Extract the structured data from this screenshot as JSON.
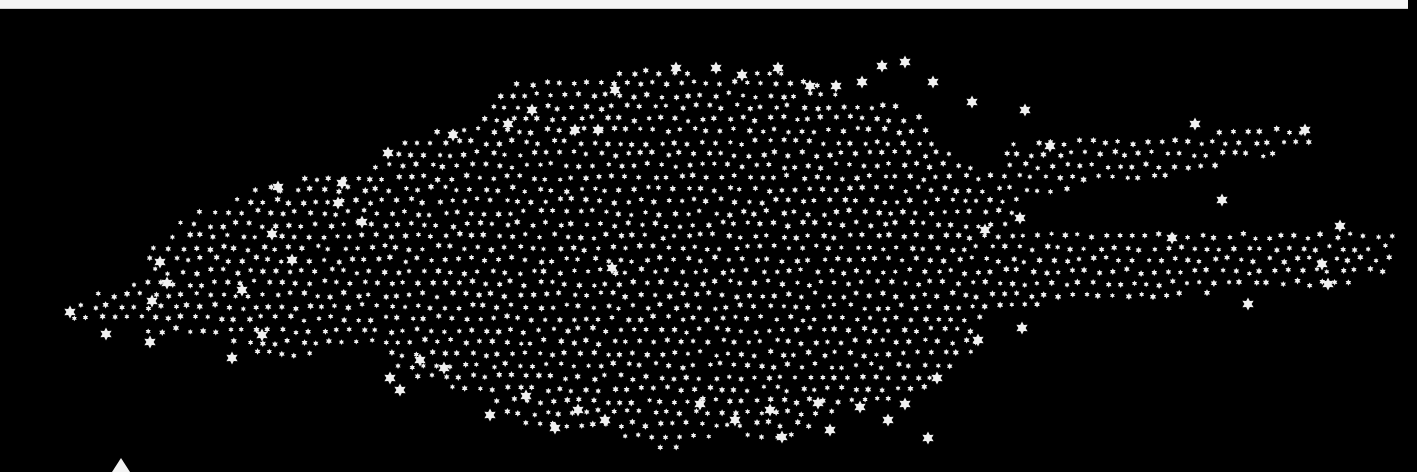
{
  "canvas": {
    "width": 1417,
    "height": 469,
    "background": "#000000"
  },
  "top_strip": {
    "color": "#f4f4f4",
    "height": 8,
    "width": 1408
  },
  "marker_triangle": {
    "x": 121,
    "y": 458,
    "color": "#f2f2f2"
  },
  "star_color": "#f0f0f0",
  "cluster": {
    "seed": 7,
    "small_star_radius": 3.2,
    "spacing": 13.5,
    "regions": [
      {
        "name": "core",
        "type": "ellipse",
        "cx": 680,
        "cy": 255,
        "rx": 345,
        "ry": 185
      },
      {
        "name": "left-wing",
        "type": "ellipse",
        "cx": 300,
        "cy": 270,
        "rx": 150,
        "ry": 85
      },
      {
        "name": "left-tail",
        "type": "band",
        "x0": 70,
        "x1": 260,
        "y_top0": 300,
        "y_top1": 255,
        "y_bot0": 322,
        "y_bot1": 345
      },
      {
        "name": "upper-left-spur",
        "type": "band",
        "x0": 275,
        "x1": 420,
        "y_top0": 180,
        "y_top1": 160,
        "y_bot0": 200,
        "y_bot1": 215
      },
      {
        "name": "right-upper-arm",
        "type": "band",
        "x0": 1000,
        "x1": 1310,
        "y_top0": 145,
        "y_top1": 125,
        "y_bot0": 205,
        "y_bot1": 150
      },
      {
        "name": "right-lower-arm",
        "type": "band",
        "x0": 990,
        "x1": 1395,
        "y_top0": 232,
        "y_top1": 228,
        "y_bot0": 310,
        "y_bot1": 280
      }
    ],
    "big_stars": [
      [
        70,
        312
      ],
      [
        106,
        334
      ],
      [
        150,
        342
      ],
      [
        152,
        301
      ],
      [
        160,
        262
      ],
      [
        167,
        283
      ],
      [
        242,
        290
      ],
      [
        232,
        358
      ],
      [
        272,
        234
      ],
      [
        262,
        335
      ],
      [
        292,
        260
      ],
      [
        278,
        187
      ],
      [
        342,
        183
      ],
      [
        338,
        203
      ],
      [
        388,
        153
      ],
      [
        362,
        222
      ],
      [
        453,
        135
      ],
      [
        508,
        124
      ],
      [
        532,
        110
      ],
      [
        575,
        130
      ],
      [
        598,
        130
      ],
      [
        615,
        90
      ],
      [
        676,
        68
      ],
      [
        716,
        68
      ],
      [
        742,
        75
      ],
      [
        778,
        68
      ],
      [
        810,
        86
      ],
      [
        836,
        86
      ],
      [
        862,
        82
      ],
      [
        882,
        66
      ],
      [
        905,
        62
      ],
      [
        933,
        82
      ],
      [
        972,
        102
      ],
      [
        1025,
        110
      ],
      [
        1050,
        146
      ],
      [
        1195,
        124
      ],
      [
        1305,
        130
      ],
      [
        1222,
        200
      ],
      [
        1340,
        226
      ],
      [
        1322,
        264
      ],
      [
        1328,
        284
      ],
      [
        1172,
        238
      ],
      [
        1248,
        304
      ],
      [
        612,
        268
      ],
      [
        390,
        378
      ],
      [
        400,
        390
      ],
      [
        420,
        360
      ],
      [
        444,
        368
      ],
      [
        490,
        415
      ],
      [
        526,
        396
      ],
      [
        555,
        428
      ],
      [
        578,
        410
      ],
      [
        605,
        420
      ],
      [
        700,
        404
      ],
      [
        735,
        420
      ],
      [
        770,
        410
      ],
      [
        782,
        437
      ],
      [
        818,
        403
      ],
      [
        830,
        430
      ],
      [
        860,
        407
      ],
      [
        888,
        420
      ],
      [
        905,
        404
      ],
      [
        928,
        438
      ],
      [
        937,
        378
      ],
      [
        978,
        340
      ],
      [
        1022,
        328
      ],
      [
        1020,
        218
      ],
      [
        985,
        230
      ]
    ],
    "big_star_radius": 6.5
  }
}
